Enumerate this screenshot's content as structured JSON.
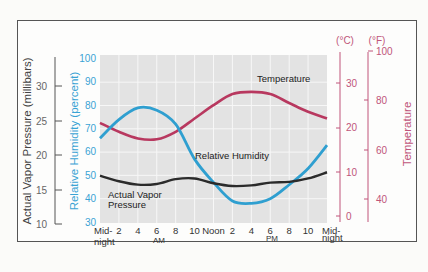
{
  "chart_data": {
    "type": "line",
    "title": "",
    "xlabel": "",
    "x": [
      "Mid-night",
      "2",
      "4",
      "6 AM",
      "8",
      "10",
      "Noon",
      "2",
      "4",
      "6 PM",
      "8",
      "10",
      "Mid-night"
    ],
    "x_hours": [
      0,
      2,
      4,
      6,
      8,
      10,
      12,
      14,
      16,
      18,
      20,
      22,
      24
    ],
    "series": [
      {
        "name": "Relative Humidity",
        "axis": "Relative Humidity (percent)",
        "unit": "percent",
        "color": "#2f9fd0",
        "values": [
          66,
          74,
          79,
          78,
          72,
          57,
          47,
          39,
          38,
          40,
          46,
          53,
          63
        ]
      },
      {
        "name": "Temperature",
        "axis": "Temperature",
        "unit": "°C",
        "color": "#b8385f",
        "values": [
          21,
          19,
          17.5,
          17.3,
          19,
          22,
          25,
          27.5,
          28,
          27.5,
          25.5,
          23.5,
          22
        ]
      },
      {
        "name": "Actual Vapor Pressure",
        "axis": "Actual Vapor Pressure (millibars)",
        "unit": "millibars",
        "color": "#2b2b2b",
        "values": [
          17,
          16.2,
          15.7,
          15.8,
          16.5,
          16.6,
          15.9,
          15.5,
          15.6,
          16,
          16.1,
          16.6,
          17.5
        ]
      }
    ],
    "axes": {
      "vapor": {
        "label": "Actual Vapor Pressure (millibars)",
        "ticks": [
          10,
          15,
          20,
          25,
          30
        ],
        "range": [
          10,
          32
        ]
      },
      "humidity": {
        "label": "Relative Humidity (percent)",
        "ticks": [
          30,
          40,
          50,
          60,
          70,
          80,
          90,
          100
        ],
        "range": [
          30,
          100
        ]
      },
      "celsius": {
        "label": "(°C)",
        "ticks": [
          0,
          10,
          20,
          30
        ],
        "range": [
          0,
          37
        ]
      },
      "fahrenheit": {
        "label": "(°F)",
        "ticks": [
          40,
          60,
          80,
          100
        ],
        "range": [
          32,
          100
        ]
      },
      "temperature_title": "Temperature"
    },
    "grid": true,
    "annotations": [
      "Temperature",
      "Relative Humidity",
      "Actual Vapor Pressure"
    ]
  },
  "labels": {
    "vapor_axis_title": "Actual Vapor Pressure (millibars)",
    "humidity_axis_title": "Relative Humidity (percent)",
    "temperature_axis_title": "Temperature",
    "celsius_unit": "(°C)",
    "fahrenheit_unit": "(°F)",
    "ann_temperature": "Temperature",
    "ann_humidity": "Relative Humidity",
    "ann_vapor_1": "Actual Vapor",
    "ann_vapor_2": "Pressure",
    "x_ticks": [
      "Mid-",
      "2",
      "4",
      "6",
      "8",
      "10",
      "Noon",
      "2",
      "4",
      "6",
      "8",
      "10",
      "Mid-"
    ],
    "x_sub": {
      "night_left": "night",
      "am": "AM",
      "pm": "PM",
      "night_right": "night"
    },
    "vapor_ticks": [
      "30",
      "25",
      "20",
      "15",
      "10"
    ],
    "humidity_ticks": [
      "100",
      "90",
      "80",
      "70",
      "60",
      "50",
      "40",
      "30"
    ],
    "celsius_ticks": [
      "30",
      "20",
      "10",
      "0"
    ],
    "fahrenheit_ticks": [
      "100",
      "80",
      "60",
      "40"
    ]
  },
  "colors": {
    "humidity": "#2f9fd0",
    "temperature": "#b8385f",
    "vapor": "#2b2b2b",
    "temp_axis": "#c0557a",
    "grid_bg": "#e3e3e3",
    "grid_line": "#f7f7f7"
  }
}
